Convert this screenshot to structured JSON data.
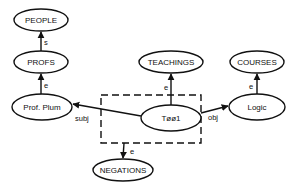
{
  "diagram": {
    "type": "semantic-network",
    "nodes": [
      {
        "id": "people",
        "label": "PEOPLE",
        "cx": 41,
        "cy": 20,
        "rx": 27,
        "ry": 11
      },
      {
        "id": "profs",
        "label": "PROFS",
        "cx": 41,
        "cy": 62,
        "rx": 27,
        "ry": 11
      },
      {
        "id": "prof_plum",
        "label": "Prof. Plum",
        "cx": 42,
        "cy": 107,
        "rx": 30,
        "ry": 13
      },
      {
        "id": "teachings",
        "label": "TEACHINGS",
        "cx": 171,
        "cy": 62,
        "rx": 32,
        "ry": 11
      },
      {
        "id": "courses",
        "label": "COURSES",
        "cx": 257,
        "cy": 62,
        "rx": 27,
        "ry": 11
      },
      {
        "id": "logic",
        "label": "Logic",
        "cx": 257,
        "cy": 107,
        "rx": 28,
        "ry": 13
      },
      {
        "id": "t001",
        "label": "Tøø1",
        "cx": 171,
        "cy": 118,
        "rx": 30,
        "ry": 13
      },
      {
        "id": "negations",
        "label": "NEGATIONS",
        "cx": 123,
        "cy": 170,
        "rx": 30,
        "ry": 11
      }
    ],
    "edges": [
      {
        "from": "profs",
        "to": "people",
        "label": "s"
      },
      {
        "from": "prof_plum",
        "to": "profs",
        "label": "e"
      },
      {
        "from": "t001",
        "to": "teachings",
        "label": "e"
      },
      {
        "from": "logic",
        "to": "courses",
        "label": "e"
      },
      {
        "from": "t001",
        "to": "prof_plum",
        "label": "subj"
      },
      {
        "from": "t001",
        "to": "logic",
        "label": "obj"
      },
      {
        "from": "dashed_box",
        "to": "negations",
        "label": "e"
      }
    ],
    "dashed_box": {
      "x": 101,
      "y": 95,
      "width": 100,
      "height": 48,
      "contains": [
        "t001"
      ]
    }
  }
}
